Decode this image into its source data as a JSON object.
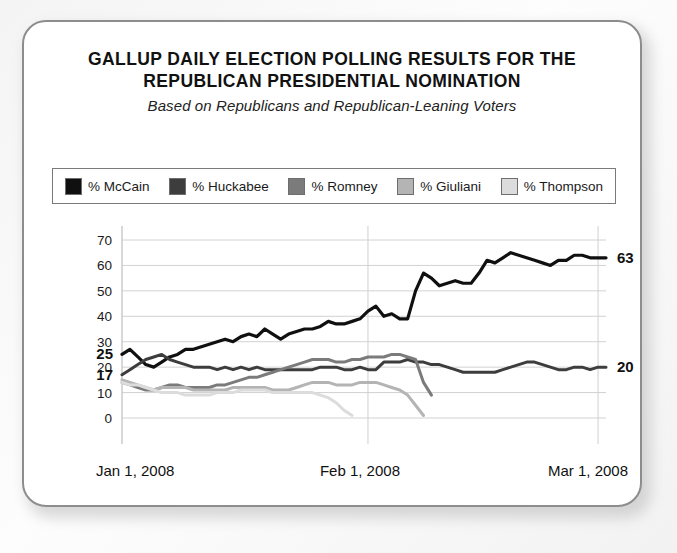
{
  "card": {
    "title_line_1": "GALLUP DAILY ELECTION POLLING RESULTS FOR THE",
    "title_line_2": "REPUBLICAN PRESIDENTIAL NOMINATION",
    "subtitle": "Based on Republicans and Republican-Leaning Voters"
  },
  "legend": {
    "items": [
      {
        "label": "% McCain",
        "color": "#101010"
      },
      {
        "label": "% Huckabee",
        "color": "#3d3d3d"
      },
      {
        "label": "% Romney",
        "color": "#7b7b7b"
      },
      {
        "label": "% Giuliani",
        "color": "#b4b4b4"
      },
      {
        "label": "% Thompson",
        "color": "#dcdcdc"
      }
    ]
  },
  "chart_data": {
    "type": "line",
    "title": "GALLUP DAILY ELECTION POLLING RESULTS FOR THE REPUBLICAN PRESIDENTIAL NOMINATION",
    "subtitle": "Based on Republicans and Republican-Leaning Voters",
    "xlabel": "",
    "ylabel": "",
    "ylim": [
      0,
      70
    ],
    "yticks": [
      0,
      10,
      20,
      30,
      40,
      50,
      60,
      70
    ],
    "grid": true,
    "legend_position": "top",
    "x_tick_labels": [
      "Jan 1, 2008",
      "Feb 1, 2008",
      "Mar 1, 2008"
    ],
    "x_tick_positions": [
      0,
      31,
      60
    ],
    "x_range": [
      0,
      61
    ],
    "annotations": [
      {
        "text": "25",
        "series": "% McCain",
        "x": 0,
        "y": 25,
        "position": "left"
      },
      {
        "text": "17",
        "series": "% Huckabee",
        "x": 0,
        "y": 17,
        "position": "left"
      },
      {
        "text": "63",
        "series": "% McCain",
        "x": 61,
        "y": 63,
        "position": "right"
      },
      {
        "text": "20",
        "series": "% Huckabee",
        "x": 61,
        "y": 20,
        "position": "right"
      }
    ],
    "series": [
      {
        "name": "% McCain",
        "color": "#101010",
        "width": 3.2,
        "x": [
          0,
          1,
          2,
          3,
          4,
          5,
          6,
          7,
          8,
          9,
          10,
          11,
          12,
          13,
          14,
          15,
          16,
          17,
          18,
          19,
          20,
          21,
          22,
          23,
          24,
          25,
          26,
          27,
          28,
          29,
          30,
          31,
          32,
          33,
          34,
          35,
          36,
          37,
          38,
          39,
          40,
          41,
          42,
          43,
          44,
          45,
          46,
          47,
          48,
          49,
          50,
          51,
          52,
          53,
          54,
          55,
          56,
          57,
          58,
          59,
          60,
          61
        ],
        "y": [
          25,
          27,
          24,
          21,
          20,
          22,
          24,
          25,
          27,
          27,
          28,
          29,
          30,
          31,
          30,
          32,
          33,
          32,
          35,
          33,
          31,
          33,
          34,
          35,
          35,
          36,
          38,
          37,
          37,
          38,
          39,
          42,
          44,
          40,
          41,
          39,
          39,
          50,
          57,
          55,
          52,
          53,
          54,
          53,
          53,
          57,
          62,
          61,
          63,
          65,
          64,
          63,
          62,
          61,
          60,
          62,
          62,
          64,
          64,
          63,
          63,
          63
        ]
      },
      {
        "name": "% Huckabee",
        "color": "#3d3d3d",
        "width": 3.0,
        "x": [
          0,
          1,
          2,
          3,
          4,
          5,
          6,
          7,
          8,
          9,
          10,
          11,
          12,
          13,
          14,
          15,
          16,
          17,
          18,
          19,
          20,
          21,
          22,
          23,
          24,
          25,
          26,
          27,
          28,
          29,
          30,
          31,
          32,
          33,
          34,
          35,
          36,
          37,
          38,
          39,
          40,
          41,
          42,
          43,
          44,
          45,
          46,
          47,
          48,
          49,
          50,
          51,
          52,
          53,
          54,
          55,
          56,
          57,
          58,
          59,
          60,
          61
        ],
        "y": [
          17,
          19,
          21,
          23,
          24,
          25,
          23,
          22,
          21,
          20,
          20,
          20,
          19,
          20,
          19,
          20,
          19,
          20,
          19,
          19,
          19,
          19,
          19,
          19,
          19,
          20,
          20,
          20,
          19,
          19,
          20,
          19,
          19,
          22,
          22,
          22,
          23,
          22,
          22,
          21,
          21,
          20,
          19,
          18,
          18,
          18,
          18,
          18,
          19,
          20,
          21,
          22,
          22,
          21,
          20,
          19,
          19,
          20,
          20,
          19,
          20,
          20
        ]
      },
      {
        "name": "% Romney",
        "color": "#7b7b7b",
        "width": 3.0,
        "x": [
          0,
          1,
          2,
          3,
          4,
          5,
          6,
          7,
          8,
          9,
          10,
          11,
          12,
          13,
          14,
          15,
          16,
          17,
          18,
          19,
          20,
          21,
          22,
          23,
          24,
          25,
          26,
          27,
          28,
          29,
          30,
          31,
          32,
          33,
          34,
          35,
          36,
          37,
          38,
          39
        ],
        "y": [
          14,
          13,
          12,
          11,
          11,
          12,
          13,
          13,
          12,
          12,
          12,
          12,
          13,
          13,
          14,
          15,
          16,
          16,
          17,
          18,
          19,
          20,
          21,
          22,
          23,
          23,
          23,
          22,
          22,
          23,
          23,
          24,
          24,
          24,
          25,
          25,
          24,
          23,
          14,
          9
        ]
      },
      {
        "name": "% Giuliani",
        "color": "#b4b4b4",
        "width": 3.0,
        "x": [
          0,
          1,
          2,
          3,
          4,
          5,
          6,
          7,
          8,
          9,
          10,
          11,
          12,
          13,
          14,
          15,
          16,
          17,
          18,
          19,
          20,
          21,
          22,
          23,
          24,
          25,
          26,
          27,
          28,
          29,
          30,
          31,
          32,
          33,
          34,
          35,
          36,
          37,
          38
        ],
        "y": [
          15,
          14,
          13,
          12,
          11,
          12,
          12,
          12,
          12,
          11,
          11,
          11,
          11,
          11,
          12,
          12,
          12,
          12,
          12,
          11,
          11,
          11,
          12,
          13,
          14,
          14,
          14,
          13,
          13,
          13,
          14,
          14,
          14,
          13,
          12,
          11,
          9,
          5,
          1
        ]
      },
      {
        "name": "% Thompson",
        "color": "#dcdcdc",
        "width": 3.0,
        "x": [
          0,
          1,
          2,
          3,
          4,
          5,
          6,
          7,
          8,
          9,
          10,
          11,
          12,
          13,
          14,
          15,
          16,
          17,
          18,
          19,
          20,
          21,
          22,
          23,
          24,
          25,
          26,
          27,
          28,
          29
        ],
        "y": [
          14,
          13,
          13,
          12,
          11,
          10,
          10,
          10,
          9,
          9,
          9,
          9,
          10,
          10,
          10,
          11,
          11,
          11,
          11,
          10,
          10,
          10,
          10,
          10,
          10,
          9,
          8,
          6,
          3,
          1
        ]
      }
    ]
  }
}
